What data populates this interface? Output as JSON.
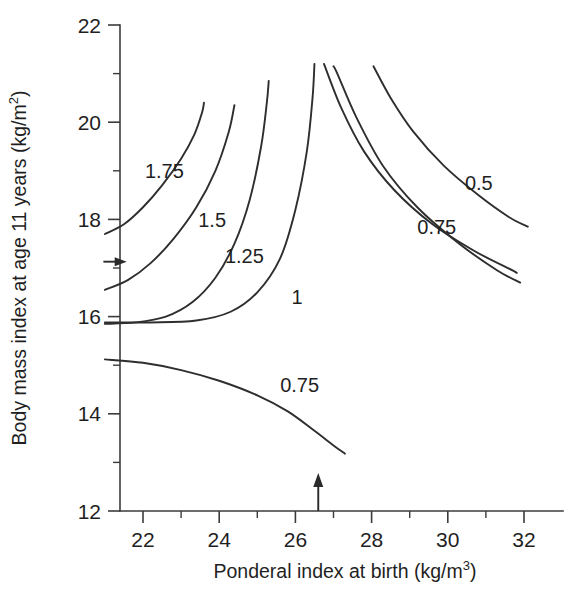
{
  "chart_data": {
    "type": "line",
    "title": "",
    "xlabel_text": "Ponderal index at birth (kg/m",
    "xlabel_sup": "3",
    "xlabel_tail": ")",
    "ylabel_text": "Body mass index at age 11 years (kg/m",
    "ylabel_sup": "2",
    "ylabel_tail": ")",
    "xlim": [
      21,
      32.5
    ],
    "ylim": [
      12,
      22
    ],
    "x_major_ticks": [
      "22",
      "24",
      "26",
      "28",
      "30",
      "32"
    ],
    "x_major_values": [
      22,
      24,
      26,
      28,
      30,
      32
    ],
    "x_minor_values": [
      23,
      25,
      27,
      29,
      31
    ],
    "y_major_ticks": [
      "12",
      "14",
      "16",
      "18",
      "20",
      "22"
    ],
    "y_major_values": [
      12,
      14,
      16,
      18,
      20,
      22
    ],
    "y_minor_values": [
      13,
      15,
      17,
      19,
      21
    ],
    "grid": false,
    "legend": "none",
    "contour_labels": [
      {
        "name": "contour-label-1-75",
        "text": "1.75",
        "x": 22.05,
        "y": 18.85
      },
      {
        "name": "contour-label-1-5",
        "text": "1.5",
        "x": 23.45,
        "y": 17.85
      },
      {
        "name": "contour-label-1-25",
        "text": "1.25",
        "x": 24.15,
        "y": 17.1
      },
      {
        "name": "contour-label-1",
        "text": "1",
        "x": 25.9,
        "y": 16.25
      },
      {
        "name": "contour-label-0-5",
        "text": "0.5",
        "x": 30.45,
        "y": 18.6
      },
      {
        "name": "contour-label-0-75-upper",
        "text": "0.75",
        "x": 29.2,
        "y": 17.7
      },
      {
        "name": "contour-label-0-75-lower",
        "text": "0.75",
        "x": 25.6,
        "y": 14.45
      }
    ],
    "contours": [
      {
        "name": "contour-1-75",
        "label": "1.75",
        "points": [
          [
            21.0,
            17.7
          ],
          [
            21.5,
            17.9
          ],
          [
            22.0,
            18.25
          ],
          [
            22.5,
            18.7
          ],
          [
            23.0,
            19.25
          ],
          [
            23.35,
            19.75
          ],
          [
            23.55,
            20.2
          ],
          [
            23.6,
            20.4
          ]
        ]
      },
      {
        "name": "contour-1-5",
        "label": "1.5",
        "points": [
          [
            21.0,
            16.55
          ],
          [
            21.6,
            16.75
          ],
          [
            22.2,
            17.1
          ],
          [
            22.8,
            17.6
          ],
          [
            23.4,
            18.25
          ],
          [
            23.9,
            19.0
          ],
          [
            24.25,
            19.8
          ],
          [
            24.4,
            20.35
          ]
        ]
      },
      {
        "name": "contour-1-25",
        "label": "1.25",
        "points": [
          [
            21.0,
            15.85
          ],
          [
            21.8,
            15.88
          ],
          [
            22.6,
            16.0
          ],
          [
            23.3,
            16.3
          ],
          [
            23.9,
            16.8
          ],
          [
            24.4,
            17.5
          ],
          [
            24.8,
            18.4
          ],
          [
            25.1,
            19.5
          ],
          [
            25.25,
            20.4
          ],
          [
            25.3,
            20.85
          ]
        ]
      },
      {
        "name": "contour-1",
        "label": "1",
        "points": [
          [
            21.0,
            15.88
          ],
          [
            22.2,
            15.88
          ],
          [
            23.4,
            15.92
          ],
          [
            24.3,
            16.1
          ],
          [
            25.0,
            16.5
          ],
          [
            25.6,
            17.2
          ],
          [
            26.0,
            18.2
          ],
          [
            26.3,
            19.4
          ],
          [
            26.45,
            20.5
          ],
          [
            26.5,
            21.2
          ]
        ]
      },
      {
        "name": "contour-upper-right-a",
        "label": "",
        "points": [
          [
            26.75,
            21.2
          ],
          [
            27.2,
            20.3
          ],
          [
            27.8,
            19.4
          ],
          [
            28.6,
            18.6
          ],
          [
            29.6,
            17.9
          ],
          [
            30.7,
            17.35
          ],
          [
            31.7,
            16.95
          ],
          [
            31.8,
            16.9
          ]
        ]
      },
      {
        "name": "contour-0-75-upper",
        "label": "0.75",
        "points": [
          [
            27.0,
            21.15
          ],
          [
            27.1,
            21.0
          ],
          [
            27.6,
            20.1
          ],
          [
            28.3,
            19.1
          ],
          [
            29.2,
            18.25
          ],
          [
            30.3,
            17.5
          ],
          [
            31.3,
            16.95
          ],
          [
            31.9,
            16.7
          ]
        ]
      },
      {
        "name": "contour-0-5",
        "label": "0.5",
        "points": [
          [
            28.05,
            21.15
          ],
          [
            28.5,
            20.5
          ],
          [
            29.1,
            19.8
          ],
          [
            29.9,
            19.1
          ],
          [
            30.8,
            18.5
          ],
          [
            31.6,
            18.05
          ],
          [
            32.1,
            17.85
          ]
        ]
      },
      {
        "name": "contour-0-75-lower",
        "label": "0.75",
        "points": [
          [
            21.0,
            15.12
          ],
          [
            22.0,
            15.05
          ],
          [
            23.0,
            14.9
          ],
          [
            24.0,
            14.68
          ],
          [
            25.0,
            14.38
          ],
          [
            25.8,
            14.05
          ],
          [
            26.5,
            13.65
          ],
          [
            27.0,
            13.35
          ],
          [
            27.3,
            13.18
          ]
        ]
      }
    ],
    "markers": [
      {
        "name": "x-axis-arrow-marker",
        "orientation": "up",
        "x": 26.6,
        "y_from": 12.0,
        "y_to": 12.72
      },
      {
        "name": "y-axis-arrow-marker",
        "orientation": "right",
        "y": 17.13,
        "x_from": 20.96,
        "x_to": 21.52
      }
    ]
  },
  "colors": {
    "contour_stroke": "#2e2e2e",
    "axis_stroke": "#3b3b3b",
    "text": "#1f1f1f",
    "background": "#ffffff"
  }
}
